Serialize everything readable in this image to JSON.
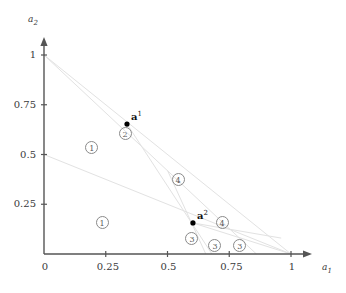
{
  "chart_data": {
    "type": "scatter",
    "title": "",
    "xlabel": "a_1",
    "ylabel": "a_2",
    "xlim": [
      0,
      1.08
    ],
    "ylim": [
      0,
      1.06
    ],
    "grid": false,
    "legend": "none",
    "xticks": [
      "0",
      "0.25",
      "0.5",
      "0.75",
      "1"
    ],
    "xtick_values": [
      0,
      0.25,
      0.5,
      0.75,
      1
    ],
    "yticks": [
      "0.25",
      "0.5",
      "0.75",
      "1"
    ],
    "ytick_values": [
      0.25,
      0.5,
      0.75,
      1
    ],
    "points": [
      {
        "name": "a1",
        "label": "a",
        "sup": "1",
        "x": 0.336,
        "y": 0.653
      },
      {
        "name": "a2",
        "label": "a",
        "sup": "2",
        "x": 0.603,
        "y": 0.156
      }
    ],
    "region_labels": [
      {
        "text": "1",
        "x": 0.194,
        "y": 0.533
      },
      {
        "text": "2",
        "x": 0.328,
        "y": 0.608
      },
      {
        "text": "1",
        "x": 0.235,
        "y": 0.156
      },
      {
        "text": "4",
        "x": 0.543,
        "y": 0.372
      },
      {
        "text": "4",
        "x": 0.721,
        "y": 0.156
      },
      {
        "text": "3",
        "x": 0.599,
        "y": 0.08
      },
      {
        "text": "3",
        "x": 0.692,
        "y": 0.045
      },
      {
        "text": "3",
        "x": 0.793,
        "y": 0.045
      }
    ],
    "lines": [
      {
        "name": "line-from-origin-top-to-a2-extended",
        "x1": 0.0,
        "y1": 1.0,
        "x2": 1.0,
        "y2": 0.0
      },
      {
        "name": "line-from-top-through-a1",
        "x1": 0.0,
        "y1": 1.0,
        "x2": 0.86,
        "y2": 0.0
      },
      {
        "name": "line-from-left-mid-to-lower-right",
        "x1": 0.0,
        "y1": 0.5,
        "x2": 1.0,
        "y2": 0.0
      },
      {
        "name": "line-a1-to-a2-extended-down",
        "x1": 0.336,
        "y1": 0.653,
        "x2": 0.68,
        "y2": 0.0
      },
      {
        "name": "line-through-a2-steep",
        "x1": 0.5,
        "y1": 0.42,
        "x2": 0.655,
        "y2": 0.0
      },
      {
        "name": "line-a2-to-right-axis",
        "x1": 0.603,
        "y1": 0.156,
        "x2": 1.0,
        "y2": 0.0
      },
      {
        "name": "line-a2-branch-right",
        "x1": 0.603,
        "y1": 0.156,
        "x2": 0.96,
        "y2": 0.08
      }
    ],
    "colors": {
      "axis": "#555555",
      "point": "#000000",
      "region_outline": "#8a8a8a",
      "construction_line": "#e2e2e2",
      "text": "#3a3a3a"
    }
  }
}
